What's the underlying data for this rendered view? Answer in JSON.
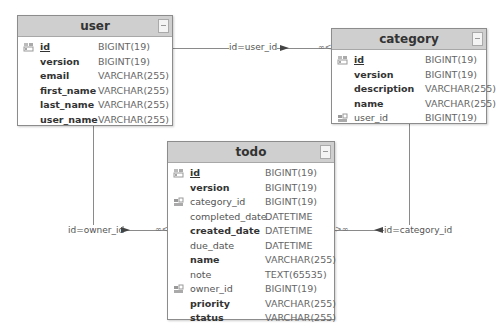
{
  "tables": {
    "user": {
      "title": "user",
      "columns": [
        {
          "name": "id",
          "type": "BIGINT(19)",
          "key": "pk",
          "bold": true
        },
        {
          "name": "version",
          "type": "BIGINT(19)",
          "key": "",
          "bold": true
        },
        {
          "name": "email",
          "type": "VARCHAR(255)",
          "key": "",
          "bold": true
        },
        {
          "name": "first_name",
          "type": "VARCHAR(255)",
          "key": "",
          "bold": true
        },
        {
          "name": "last_name",
          "type": "VARCHAR(255)",
          "key": "",
          "bold": true
        },
        {
          "name": "user_name",
          "type": "VARCHAR(255)",
          "key": "",
          "bold": true
        }
      ]
    },
    "category": {
      "title": "category",
      "columns": [
        {
          "name": "id",
          "type": "BIGINT(19)",
          "key": "pk",
          "bold": true
        },
        {
          "name": "version",
          "type": "BIGINT(19)",
          "key": "",
          "bold": true
        },
        {
          "name": "description",
          "type": "VARCHAR(255)",
          "key": "",
          "bold": true
        },
        {
          "name": "name",
          "type": "VARCHAR(255)",
          "key": "",
          "bold": true
        },
        {
          "name": "user_id",
          "type": "BIGINT(19)",
          "key": "fk",
          "bold": false
        }
      ]
    },
    "todo": {
      "title": "todo",
      "columns": [
        {
          "name": "id",
          "type": "BIGINT(19)",
          "key": "pk",
          "bold": true
        },
        {
          "name": "version",
          "type": "BIGINT(19)",
          "key": "",
          "bold": true
        },
        {
          "name": "category_id",
          "type": "BIGINT(19)",
          "key": "fk",
          "bold": false
        },
        {
          "name": "completed_date",
          "type": "DATETIME",
          "key": "",
          "bold": false
        },
        {
          "name": "created_date",
          "type": "DATETIME",
          "key": "",
          "bold": true
        },
        {
          "name": "due_date",
          "type": "DATETIME",
          "key": "",
          "bold": false
        },
        {
          "name": "name",
          "type": "VARCHAR(255)",
          "key": "",
          "bold": true
        },
        {
          "name": "note",
          "type": "TEXT(65535)",
          "key": "",
          "bold": false
        },
        {
          "name": "owner_id",
          "type": "BIGINT(19)",
          "key": "fk",
          "bold": false
        },
        {
          "name": "priority",
          "type": "VARCHAR(255)",
          "key": "",
          "bold": true
        },
        {
          "name": "status",
          "type": "VARCHAR(255)",
          "key": "",
          "bold": true
        }
      ]
    }
  },
  "relations": [
    {
      "label": "id=user_id",
      "from": "user",
      "to": "category"
    },
    {
      "label": "id=owner_id",
      "from": "user",
      "to": "todo"
    },
    {
      "label": "id=category_id",
      "from": "category",
      "to": "todo"
    }
  ],
  "icons": {
    "pk": "key-icon",
    "fk": "foreign-key-icon",
    "collapse": "collapse-icon"
  }
}
